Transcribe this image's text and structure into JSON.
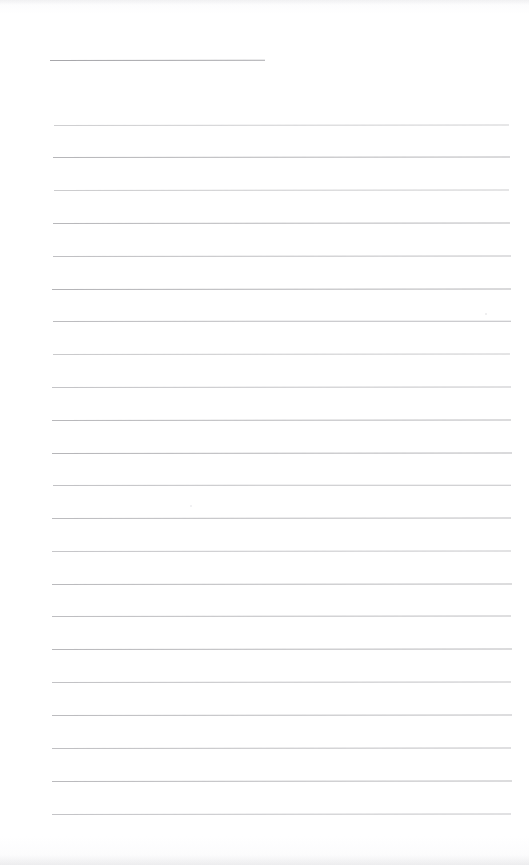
{
  "document": {
    "kind": "scanned-lined-page",
    "title": "Blank ruled notebook page",
    "page_width": 529,
    "page_height": 865,
    "background_color": "#ffffff",
    "rule_color": "#9a9a9e",
    "text_content": "",
    "visible_text": [],
    "notes": "No printed or handwritten text is present; the page shows only horizontal ruled lines."
  },
  "rules": {
    "header_rule": {
      "label": "header-rule",
      "x": 50,
      "y": 60,
      "width": 215,
      "opacity": 0.78,
      "slope_deg": -0.08
    },
    "body_rule_count": 22,
    "body_rule_left": 52,
    "body_rule_right": 512,
    "body_rule_first_y": 125,
    "body_rule_spacing": 32.75,
    "body_rules": [
      {
        "y": 125,
        "x": 54,
        "width": 455,
        "opacity": 0.48,
        "slope_deg": -0.06
      },
      {
        "y": 157,
        "x": 53,
        "width": 457,
        "opacity": 0.72,
        "slope_deg": -0.07
      },
      {
        "y": 190,
        "x": 54,
        "width": 455,
        "opacity": 0.5,
        "slope_deg": -0.05
      },
      {
        "y": 223,
        "x": 53,
        "width": 457,
        "opacity": 0.7,
        "slope_deg": -0.06
      },
      {
        "y": 256,
        "x": 53,
        "width": 458,
        "opacity": 0.62,
        "slope_deg": -0.05
      },
      {
        "y": 289,
        "x": 52,
        "width": 459,
        "opacity": 0.74,
        "slope_deg": -0.07
      },
      {
        "y": 321,
        "x": 53,
        "width": 458,
        "opacity": 0.66,
        "slope_deg": -0.04
      },
      {
        "y": 354,
        "x": 53,
        "width": 457,
        "opacity": 0.52,
        "slope_deg": -0.06
      },
      {
        "y": 387,
        "x": 52,
        "width": 459,
        "opacity": 0.58,
        "slope_deg": -0.05
      },
      {
        "y": 420,
        "x": 52,
        "width": 459,
        "opacity": 0.7,
        "slope_deg": -0.06
      },
      {
        "y": 453,
        "x": 52,
        "width": 460,
        "opacity": 0.72,
        "slope_deg": -0.05
      },
      {
        "y": 485,
        "x": 53,
        "width": 458,
        "opacity": 0.6,
        "slope_deg": -0.04
      },
      {
        "y": 518,
        "x": 52,
        "width": 459,
        "opacity": 0.66,
        "slope_deg": -0.06
      },
      {
        "y": 551,
        "x": 52,
        "width": 459,
        "opacity": 0.56,
        "slope_deg": -0.05
      },
      {
        "y": 584,
        "x": 52,
        "width": 460,
        "opacity": 0.68,
        "slope_deg": -0.06
      },
      {
        "y": 616,
        "x": 52,
        "width": 459,
        "opacity": 0.64,
        "slope_deg": -0.05
      },
      {
        "y": 649,
        "x": 52,
        "width": 460,
        "opacity": 0.7,
        "slope_deg": -0.06
      },
      {
        "y": 682,
        "x": 52,
        "width": 459,
        "opacity": 0.6,
        "slope_deg": -0.05
      },
      {
        "y": 715,
        "x": 52,
        "width": 460,
        "opacity": 0.66,
        "slope_deg": -0.06
      },
      {
        "y": 748,
        "x": 52,
        "width": 459,
        "opacity": 0.62,
        "slope_deg": -0.05
      },
      {
        "y": 781,
        "x": 52,
        "width": 460,
        "opacity": 0.68,
        "slope_deg": -0.06
      },
      {
        "y": 814,
        "x": 52,
        "width": 459,
        "opacity": 0.58,
        "slope_deg": -0.05
      }
    ]
  },
  "specks": [
    {
      "label": "speck-upper-right",
      "x": 485,
      "y": 313,
      "size": 2.2,
      "opacity": 0.55
    },
    {
      "label": "speck-mid-left",
      "x": 190,
      "y": 505,
      "size": 2.0,
      "opacity": 0.45
    }
  ]
}
